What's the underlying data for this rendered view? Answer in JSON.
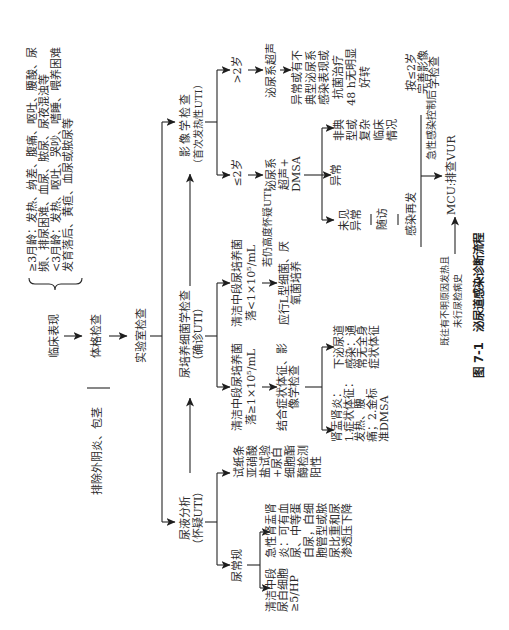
{
  "figure": {
    "label": "图 7-1",
    "title": "泌尿道感染诊断流程"
  },
  "flow": {
    "clinical": {
      "label": "临床表现",
      "symptoms": [
        "≥3月龄：发热、纳差、腹痛、呕吐、腰酸、尿",
        "频、排尿困难、血尿、脓尿、尿夜混浊等",
        "<3月龄：发热、呕吐、哭吵、嗜睡、喂养困难",
        "发育落后、黄疸、血尿或脓尿等"
      ]
    },
    "physical_exam": {
      "label": "体格检查",
      "exclude_note": "排除外阴炎、包茎"
    },
    "lab": {
      "label": "实验室检查"
    },
    "urinalysis": {
      "title": "尿液分析",
      "subtitle": "（怀疑UTI）",
      "dipstick": [
        "试纸条",
        "亚硝酸",
        "盐试验",
        "+尿白",
        "细胞酯",
        "酶检测",
        "阳性"
      ],
      "routine": {
        "label": "尿常规",
        "pyelonephritis": [
          "急性肾盂肾",
          "炎：可有血",
          "尿、中等蛋",
          "白尿，白细",
          "胞管型或脓",
          "尿比重和尿",
          "渗透压下降"
        ],
        "wbc": [
          "清洁中段",
          "尿白细胞",
          "≥5/HP"
        ]
      }
    },
    "culture": {
      "title": "尿培养细菌学检查",
      "subtitle": "（确诊UTI）",
      "positive": {
        "criteria": [
          "清洁中段尿培养菌",
          "落≥1×10⁵/mL"
        ],
        "next": [
          "结合症状体征、影",
          "像学检查"
        ],
        "pyelonephritis": [
          "肾盂肾炎：",
          "1.症状体征：",
          "发热、腰",
          "痛；2.金标",
          "准DMSA"
        ],
        "lower_uti": [
          "下泌尿道",
          "感染：通",
          "常无全身",
          "症状体征"
        ]
      },
      "negative": {
        "criteria": [
          "清洁中段尿培养菌",
          "落<1×10⁵/mL"
        ],
        "condition": "若仍高度怀疑UTI",
        "action": [
          "应行L型细菌、厌",
          "氧菌培养"
        ]
      }
    },
    "imaging": {
      "title": "影像学检查",
      "subtitle": "（首次发热性UTI）",
      "over2": {
        "label": ">2岁",
        "exam": "泌尿系超声",
        "abnormal": [
          "异常或有不",
          "典型泌尿系",
          "感染表现或",
          "抗菌治疗",
          "48 h无明显",
          "好转"
        ],
        "next": [
          "按≤2岁",
          "完善影像",
          "学检查"
        ]
      },
      "under2": {
        "label": "≤2岁",
        "exam": [
          "泌尿系",
          "超声+",
          "DMSA"
        ],
        "atypical": [
          "非典",
          "型或",
          "复杂",
          "临床",
          "情况"
        ],
        "abnormal": "异常",
        "normal": [
          "未见",
          "异常"
        ],
        "followup": "随访",
        "recurrence": "感染再发"
      }
    },
    "vur": {
      "after_label": "急性感染控制后",
      "mcu": "MCU:排查VUR",
      "history": [
        "既往有不明原因发热且",
        "未行尿检病史"
      ]
    }
  }
}
